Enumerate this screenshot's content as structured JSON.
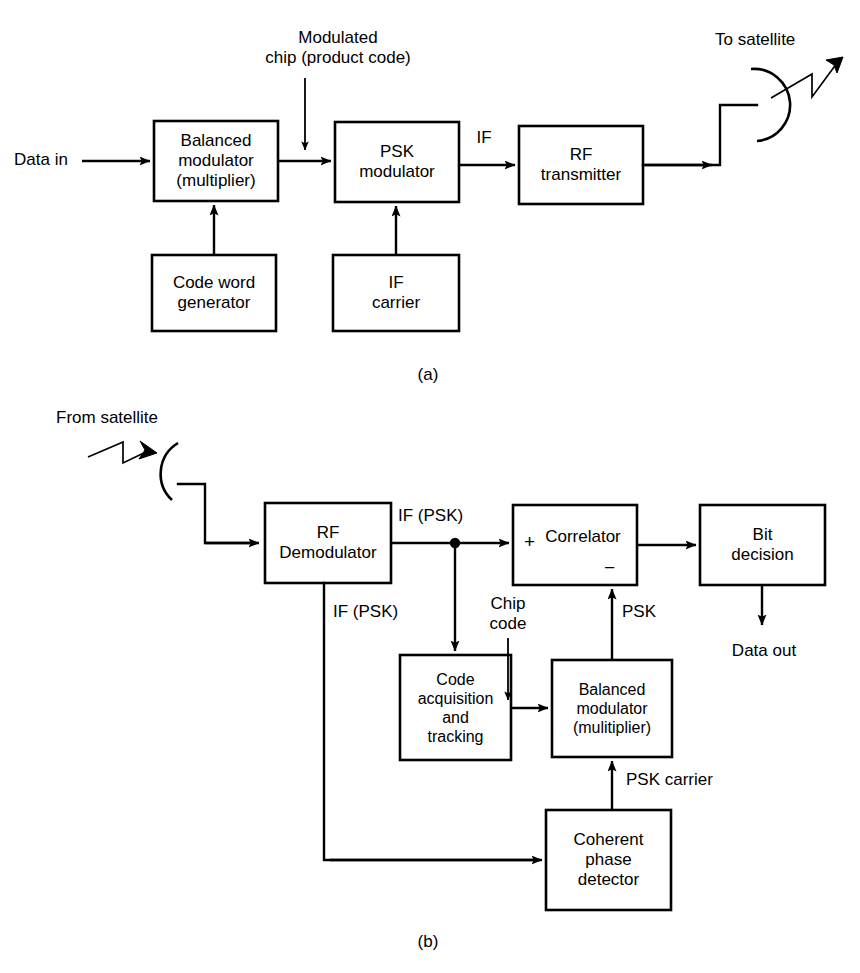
{
  "figure": {
    "background": "#ffffff",
    "line_color": "#000000",
    "title_a": "(a)",
    "title_b": "(b)"
  },
  "diagram_a": {
    "caption": "(a)",
    "boxes": [
      {
        "id": "balanced-modulator",
        "label": "Balanced\nmodulator\n(multiplier)",
        "x": 154,
        "y": 121,
        "w": 124,
        "h": 80
      },
      {
        "id": "psk-modulator",
        "label": "PSK\nmodulator",
        "x": 335,
        "y": 122,
        "w": 124,
        "h": 80
      },
      {
        "id": "rf-transmitter",
        "label": "RF\ntransmitter",
        "x": 519,
        "y": 126,
        "w": 124,
        "h": 78
      },
      {
        "id": "code-word-generator",
        "label": "Code word\ngenerator",
        "x": 152,
        "y": 255,
        "w": 124,
        "h": 76
      },
      {
        "id": "if-carrier",
        "label": "IF\ncarrier",
        "x": 333,
        "y": 255,
        "w": 126,
        "h": 76
      }
    ],
    "labels": [
      {
        "id": "data-in",
        "text": "Data in",
        "x": 20,
        "y": 145
      },
      {
        "id": "modulated-chip",
        "text": "Modulated\nchip (product code)",
        "x": 310,
        "y": 32
      },
      {
        "id": "if-label-a",
        "text": "IF",
        "x": 478,
        "y": 127
      },
      {
        "id": "to-satellite",
        "text": "To satellite",
        "x": 727,
        "y": 33
      }
    ]
  },
  "diagram_b": {
    "caption": "(b)",
    "boxes": [
      {
        "id": "rf-demodulator",
        "label": "RF\nDemodulator",
        "x": 265,
        "y": 503,
        "w": 126,
        "h": 80
      },
      {
        "id": "correlator",
        "label": "Correlator",
        "x": 513,
        "y": 505,
        "w": 124,
        "h": 80
      },
      {
        "id": "bit-decision",
        "label": "Bit\ndecision",
        "x": 700,
        "y": 505,
        "w": 125,
        "h": 80
      },
      {
        "id": "code-acquisition-tracking",
        "label": "Code\nacquisition\nand\ntracking",
        "x": 400,
        "y": 655,
        "w": 111,
        "h": 105
      },
      {
        "id": "balanced-modulator-rx",
        "label": "Balanced\nmodulator\n(mulitiplier)",
        "x": 552,
        "y": 660,
        "w": 120,
        "h": 97
      },
      {
        "id": "coherent-phase-detector",
        "label": "Coherent\nphase\ndetector",
        "x": 546,
        "y": 810,
        "w": 125,
        "h": 100
      }
    ],
    "labels": [
      {
        "id": "from-satellite",
        "text": "From satellite",
        "x": 62,
        "y": 412
      },
      {
        "id": "if-psk-top",
        "text": "IF (PSK)",
        "x": 409,
        "y": 505
      },
      {
        "id": "if-psk-left",
        "text": "IF (PSK)",
        "x": 330,
        "y": 601
      },
      {
        "id": "chip-code",
        "text": "Chip\ncode",
        "x": 490,
        "y": 597
      },
      {
        "id": "psk-label",
        "text": "PSK",
        "x": 597,
        "y": 600
      },
      {
        "id": "psk-carrier",
        "text": "PSK carrier",
        "x": 684,
        "y": 771
      },
      {
        "id": "data-out",
        "text": "Data out",
        "x": 726,
        "y": 643
      }
    ],
    "correlator_signs": {
      "plus": "+",
      "minus": "−"
    }
  },
  "icons": {
    "dish_antenna_tx": "antenna-dish-icon",
    "dish_antenna_rx": "antenna-dish-icon",
    "signal_wave_tx": "signal-wave-icon",
    "signal_wave_rx": "signal-wave-icon",
    "junction_dot": "junction-dot-icon"
  }
}
